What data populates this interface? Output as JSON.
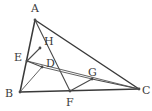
{
  "figure": {
    "kind": "geometry-diagram",
    "width": 152,
    "height": 111,
    "background_color": "#ffffff",
    "line_color": "#4a4a4a",
    "label_color": "#3b3b3b"
  },
  "points": {
    "A": {
      "label": "A",
      "x": 35,
      "y": 20,
      "label_x": 31,
      "label_y": 3
    },
    "B": {
      "label": "B",
      "x": 20,
      "y": 92,
      "label_x": 5,
      "label_y": 88
    },
    "C": {
      "label": "C",
      "x": 139,
      "y": 89,
      "label_x": 142,
      "label_y": 85
    },
    "D": {
      "label": "D",
      "x": 42,
      "y": 67,
      "label_x": 46,
      "label_y": 58
    },
    "E": {
      "label": "E",
      "x": 27,
      "y": 61,
      "label_x": 14,
      "label_y": 52
    },
    "F": {
      "label": "F",
      "x": 70,
      "y": 91,
      "label_x": 66,
      "label_y": 97
    },
    "G": {
      "label": "G",
      "x": 92,
      "y": 79,
      "label_x": 88,
      "label_y": 67
    },
    "H": {
      "label": "H",
      "x": 40,
      "y": 48,
      "label_x": 44,
      "label_y": 36
    }
  },
  "segments": [
    {
      "name": "AB",
      "from": "A",
      "to": "B",
      "weight": "strong"
    },
    {
      "name": "BC",
      "from": "B",
      "to": "C",
      "weight": "strong"
    },
    {
      "name": "AC",
      "from": "A",
      "to": "C",
      "weight": "strong"
    },
    {
      "name": "AF",
      "from": "A",
      "to": "F",
      "weight": "normal"
    },
    {
      "name": "EH",
      "from": "E",
      "to": "H",
      "weight": "normal"
    },
    {
      "name": "EC",
      "from": "E",
      "to": "C",
      "weight": "thin"
    },
    {
      "name": "ED",
      "from": "E",
      "to": "D",
      "weight": "normal"
    },
    {
      "name": "DG",
      "from": "D",
      "to": "G",
      "weight": "thin"
    },
    {
      "name": "FG",
      "from": "F",
      "to": "G",
      "weight": "normal"
    },
    {
      "name": "GC",
      "from": "G",
      "to": "C",
      "weight": "normal"
    },
    {
      "name": "BD",
      "from": "B",
      "to": "D",
      "weight": "thin"
    }
  ],
  "vertex_order": [
    "A",
    "B",
    "C",
    "D",
    "E",
    "F",
    "G",
    "H"
  ]
}
